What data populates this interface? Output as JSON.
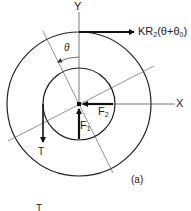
{
  "figure": {
    "caption": "(a)",
    "labels": {
      "y_axis": "Y",
      "x_axis": "X",
      "tangential_force": "KR",
      "tangential_force_sub": "2",
      "tangential_force_args_open": "(θ+θ",
      "tangential_force_args_sub": "0",
      "tangential_force_args_close": ")",
      "angle": "θ",
      "force_1": "F",
      "force_1_sub": "1",
      "force_2": "F",
      "force_2_sub": "2",
      "torque": "T",
      "bottom_partial": "T"
    },
    "colors": {
      "line": "#222222",
      "thin_line": "#555555",
      "background": "#ffffff"
    }
  }
}
